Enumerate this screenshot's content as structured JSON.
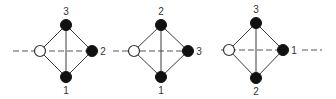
{
  "colors": {
    "background": "#ffffff",
    "line": "#3a3a3a",
    "filled_node": "#111111",
    "open_node": "#ffffff"
  },
  "diagrams": [
    {
      "nodes": {
        "top": {
          "x": 66,
          "y": 25,
          "label": "3",
          "label_pos": [
            66,
            15
          ]
        },
        "right": {
          "x": 92,
          "y": 51,
          "label": "2",
          "label_pos": [
            103,
            55
          ]
        },
        "bottom": {
          "x": 66,
          "y": 77,
          "label": "1",
          "label_pos": [
            66,
            94
          ]
        },
        "open": {
          "x": 40,
          "y": 51
        }
      },
      "axis": {
        "x1": 13,
        "x2": 92,
        "y": 51
      }
    },
    {
      "nodes": {
        "top": {
          "x": 161,
          "y": 25,
          "label": "2",
          "label_pos": [
            161,
            15
          ]
        },
        "right": {
          "x": 188,
          "y": 51,
          "label": "3",
          "label_pos": [
            199,
            55
          ]
        },
        "bottom": {
          "x": 161,
          "y": 77,
          "label": "1",
          "label_pos": [
            161,
            94
          ]
        },
        "open": {
          "x": 134,
          "y": 51
        }
      },
      "axis": {
        "x1": 113,
        "x2": 188,
        "y": 51
      }
    },
    {
      "nodes": {
        "top": {
          "x": 256,
          "y": 23,
          "label": "3",
          "label_pos": [
            256,
            13
          ]
        },
        "right": {
          "x": 283,
          "y": 50,
          "label": "1",
          "label_pos": [
            294,
            54
          ]
        },
        "bottom": {
          "x": 256,
          "y": 78,
          "label": "2",
          "label_pos": [
            256,
            95
          ]
        },
        "open": {
          "x": 229,
          "y": 50
        }
      },
      "axis": {
        "x1": 221,
        "x2": 283,
        "y": 50,
        "tail_x1": 302,
        "tail_x2": 322
      }
    }
  ]
}
